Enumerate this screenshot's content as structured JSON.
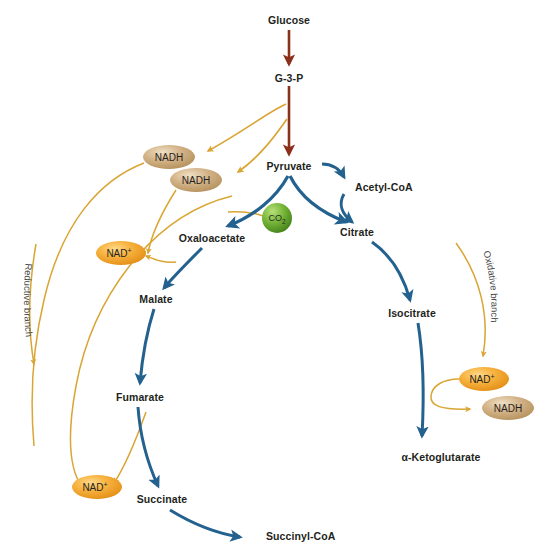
{
  "diagram": {
    "background_color": "#ffffff",
    "colors": {
      "glycolysis_arrow": "#8c2f1b",
      "tca_arrow": "#23618f",
      "cofactor_arrow": "#d9a533",
      "nad_fill": "#f0a32a",
      "nadh_fill": "#c8a57a",
      "co2_fill": "#6aa832",
      "label_text": "#231f20",
      "branch_text": "#4a4a4a"
    },
    "metabolites": [
      {
        "id": "glucose",
        "label": "Glucose",
        "x": 289,
        "y": 20
      },
      {
        "id": "g3p",
        "label": "G-3-P",
        "x": 289,
        "y": 78
      },
      {
        "id": "pyruvate",
        "label": "Pyruvate",
        "x": 289,
        "y": 166
      },
      {
        "id": "acetyl-coa",
        "label": "Acetyl-CoA",
        "x": 350,
        "y": 187
      },
      {
        "id": "citrate",
        "label": "Citrate",
        "x": 357,
        "y": 232
      },
      {
        "id": "isocitrate",
        "label": "Isocitrate",
        "x": 412,
        "y": 313
      },
      {
        "id": "ketoglutarate",
        "label": "α-Ketoglutarate",
        "x": 441,
        "y": 457
      },
      {
        "id": "oxaloacetate",
        "label": "Oxaloacetate",
        "x": 212,
        "y": 238
      },
      {
        "id": "malate",
        "label": "Malate",
        "x": 156,
        "y": 299
      },
      {
        "id": "fumarate",
        "label": "Fumarate",
        "x": 140,
        "y": 397
      },
      {
        "id": "succinate",
        "label": "Succinate",
        "x": 162,
        "y": 499
      },
      {
        "id": "succinyl-coa",
        "label": "Succinyl-CoA",
        "x": 266,
        "y": 536
      }
    ],
    "cofactors": [
      {
        "id": "nadh-glycolysis-1",
        "label": "NADH",
        "type": "nadh",
        "cx": 169,
        "cy": 157,
        "rx": 26,
        "ry": 12
      },
      {
        "id": "nadh-glycolysis-2",
        "label": "NADH",
        "type": "nadh",
        "cx": 196,
        "cy": 180,
        "rx": 26,
        "ry": 12
      },
      {
        "id": "nad-malate",
        "label": "NAD",
        "sup": "+",
        "type": "nad",
        "cx": 121,
        "cy": 253,
        "rx": 25,
        "ry": 12
      },
      {
        "id": "nad-succinate",
        "label": "NAD",
        "sup": "+",
        "type": "nad",
        "cx": 97,
        "cy": 487,
        "rx": 25,
        "ry": 12
      },
      {
        "id": "nad-isocitrate",
        "label": "NAD",
        "sup": "+",
        "type": "nad",
        "cx": 484,
        "cy": 379,
        "rx": 25,
        "ry": 12
      },
      {
        "id": "nadh-isocitrate",
        "label": "NADH",
        "type": "nadh",
        "cx": 508,
        "cy": 408,
        "rx": 26,
        "ry": 12
      }
    ],
    "co2": {
      "id": "co2",
      "label": "CO",
      "sub": "2",
      "cx": 277,
      "cy": 218,
      "r": 15
    },
    "branches": [
      {
        "id": "reductive-branch",
        "label": "Reductive branch"
      },
      {
        "id": "oxidative-branch",
        "label": "Oxidative branch"
      }
    ]
  }
}
